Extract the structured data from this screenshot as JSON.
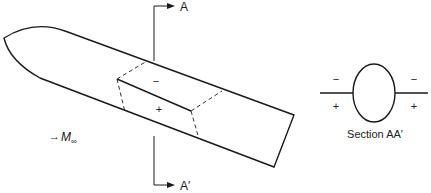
{
  "diagram": {
    "cut_labels": {
      "top": "A",
      "bottom": "A′"
    },
    "freestream": {
      "arrow": "→",
      "symbol": "M",
      "subscript": "∞"
    },
    "body_signs": {
      "upper": "−",
      "lower": "+"
    },
    "section": {
      "caption": "Section AA′",
      "signs": {
        "left_upper": "−",
        "left_lower": "+",
        "right_upper": "−",
        "right_lower": "+"
      }
    }
  }
}
